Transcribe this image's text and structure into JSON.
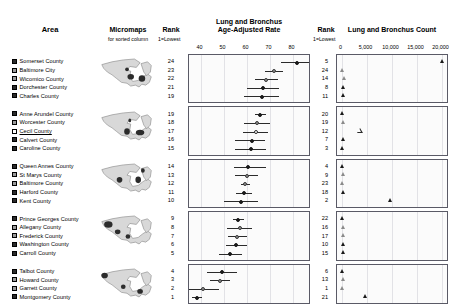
{
  "headers": {
    "area": "Area",
    "micromaps": "Micromaps",
    "micromaps_sub": "for sorted column",
    "rank_left": "Rank",
    "rank_left_sub": "1=Lowest",
    "rate_title_line1": "Lung and Bronchus",
    "rate_title_line2": "Age-Adjusted Rate",
    "rank_right": "Rank",
    "rank_right_sub": "1=Lowest",
    "count_title": "Lung and Bronchus Count"
  },
  "chart_data": {
    "type": "scatter",
    "panels": [
      {
        "xlabel": "Lung and Bronchus Age-Adjusted Rate",
        "xlim": [
          35,
          88
        ],
        "ticks": [
          40,
          50,
          60,
          70,
          80
        ],
        "tick_labels": [
          "40",
          "50",
          "60",
          "70",
          "80"
        ],
        "marker": "dot-with-ci",
        "grid": true
      },
      {
        "xlabel": "Lung and Bronchus Count",
        "xlim": [
          -900,
          21500
        ],
        "ticks": [
          0,
          5000,
          10000,
          15000,
          20000
        ],
        "tick_labels": [
          "0",
          "5,000",
          "10,000",
          "15,000",
          "20,000"
        ],
        "marker": "triangle",
        "grid": true
      }
    ],
    "groups": [
      {
        "rows": [
          {
            "area": "Somerset County",
            "rank_rate": 24,
            "rate": 82.0,
            "ci_low": 75.0,
            "ci_high": 89.0,
            "rank_count": 5,
            "count": 20300,
            "glyph": "filled",
            "selected": false
          },
          {
            "area": "Baltimore City",
            "rank_rate": 23,
            "rate": 72.0,
            "ci_low": 68.0,
            "ci_high": 76.0,
            "rank_count": 24,
            "count": 250,
            "glyph": "half",
            "selected": false
          },
          {
            "area": "Wicomico County",
            "rank_rate": 22,
            "rate": 68.5,
            "ci_low": 63.5,
            "ci_high": 73.5,
            "rank_count": 14,
            "count": 600,
            "glyph": "half",
            "selected": false
          },
          {
            "area": "Dorchester County",
            "rank_rate": 21,
            "rate": 67.0,
            "ci_low": 60.0,
            "ci_high": 74.0,
            "rank_count": 8,
            "count": 450,
            "glyph": "filled",
            "selected": false
          },
          {
            "area": "Charles County",
            "rank_rate": 19,
            "rate": 66.5,
            "ci_low": 59.0,
            "ci_high": 74.0,
            "rank_count": 11,
            "count": 500,
            "glyph": "filled",
            "selected": false
          }
        ]
      },
      {
        "rows": [
          {
            "area": "Anne Arundel County",
            "rank_rate": 19,
            "rate": 66.0,
            "ci_low": 63.5,
            "ci_high": 68.5,
            "rank_count": 20,
            "count": 250,
            "glyph": "filled",
            "selected": false
          },
          {
            "area": "Worcester County",
            "rank_rate": 18,
            "rate": 64.5,
            "ci_low": 59.0,
            "ci_high": 70.0,
            "rank_count": 19,
            "count": 350,
            "glyph": "half",
            "selected": false
          },
          {
            "area": "Cecil County",
            "rank_rate": 17,
            "rate": 64.0,
            "ci_low": 58.5,
            "ci_high": 69.5,
            "rank_count": 12,
            "count": 3700,
            "glyph": "open",
            "selected": true
          },
          {
            "area": "Calvert County",
            "rank_rate": 16,
            "rate": 62.5,
            "ci_low": 55.0,
            "ci_high": 68.0,
            "rank_count": 7,
            "count": 350,
            "glyph": "filled",
            "selected": false
          },
          {
            "area": "Caroline County",
            "rank_rate": 15,
            "rate": 62.0,
            "ci_low": 55.0,
            "ci_high": 68.5,
            "rank_count": 3,
            "count": 300,
            "glyph": "filled",
            "selected": false
          }
        ]
      },
      {
        "rows": [
          {
            "area": "Queen Annes County",
            "rank_rate": 14,
            "rate": 60.5,
            "ci_low": 54.5,
            "ci_high": 68.5,
            "rank_count": 4,
            "count": 250,
            "glyph": "filled",
            "selected": false
          },
          {
            "area": "St Marys County",
            "rank_rate": 13,
            "rate": 60.0,
            "ci_low": 55.0,
            "ci_high": 65.0,
            "rank_count": 9,
            "count": 400,
            "glyph": "half",
            "selected": false
          },
          {
            "area": "Baltimore County",
            "rank_rate": 12,
            "rate": 59.5,
            "ci_low": 57.5,
            "ci_high": 61.5,
            "rank_count": 23,
            "count": 300,
            "glyph": "half",
            "selected": false
          },
          {
            "area": "Harford County",
            "rank_rate": 11,
            "rate": 59.0,
            "ci_low": 55.5,
            "ci_high": 62.5,
            "rank_count": 18,
            "count": 450,
            "glyph": "filled",
            "selected": false
          },
          {
            "area": "Kent County",
            "rank_rate": 10,
            "rate": 57.5,
            "ci_low": 50.0,
            "ci_high": 65.0,
            "rank_count": 2,
            "count": 9800,
            "glyph": "filled",
            "selected": false
          }
        ]
      },
      {
        "rows": [
          {
            "area": "Prince Georges County",
            "rank_rate": 9,
            "rate": 56.5,
            "ci_low": 54.0,
            "ci_high": 59.0,
            "rank_count": 22,
            "count": 300,
            "glyph": "filled",
            "selected": false
          },
          {
            "area": "Allegany County",
            "rank_rate": 8,
            "rate": 57.0,
            "ci_low": 51.5,
            "ci_high": 62.5,
            "rank_count": 16,
            "count": 500,
            "glyph": "half",
            "selected": false
          },
          {
            "area": "Frederick County",
            "rank_rate": 7,
            "rate": 56.0,
            "ci_low": 52.0,
            "ci_high": 60.0,
            "rank_count": 17,
            "count": 450,
            "glyph": "half",
            "selected": false
          },
          {
            "area": "Washington County",
            "rank_rate": 6,
            "rate": 55.5,
            "ci_low": 51.0,
            "ci_high": 60.0,
            "rank_count": 10,
            "count": 500,
            "glyph": "filled",
            "selected": false
          },
          {
            "area": "Carroll County",
            "rank_rate": 5,
            "rate": 53.0,
            "ci_low": 48.0,
            "ci_high": 58.0,
            "rank_count": 15,
            "count": 400,
            "glyph": "filled",
            "selected": false
          }
        ]
      },
      {
        "rows": [
          {
            "area": "Talbot County",
            "rank_rate": 4,
            "rate": 49.5,
            "ci_low": 43.0,
            "ci_high": 56.0,
            "rank_count": 6,
            "count": 250,
            "glyph": "filled",
            "selected": false
          },
          {
            "area": "Howard County",
            "rank_rate": 3,
            "rate": 48.5,
            "ci_low": 44.0,
            "ci_high": 53.0,
            "rank_count": 13,
            "count": 400,
            "glyph": "half",
            "selected": false
          },
          {
            "area": "Garrett County",
            "rank_rate": 2,
            "rate": 41.0,
            "ci_low": 34.0,
            "ci_high": 48.0,
            "rank_count": 1,
            "count": 200,
            "glyph": "half",
            "selected": false
          },
          {
            "area": "Montgomery County",
            "rank_rate": 1,
            "rate": 38.5,
            "ci_low": 36.5,
            "ci_high": 40.5,
            "rank_count": 21,
            "count": 4800,
            "glyph": "filled",
            "selected": false
          }
        ]
      }
    ]
  }
}
